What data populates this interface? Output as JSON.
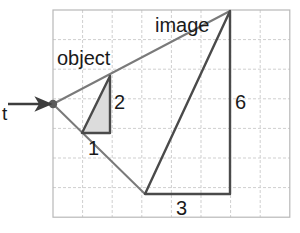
{
  "figure": {
    "background_color": "#ffffff",
    "grid": {
      "x0": 53,
      "y0": 10,
      "cell": 29.6,
      "cols": 8,
      "rows": 7,
      "line_color": "#cfcfcf",
      "border_color": "#b8b8b8",
      "style": "dashed"
    },
    "colors": {
      "stroke_dark": "#4a4a4a",
      "stroke_light": "#7a7a7a",
      "shade_fill": "#dcdcdc",
      "text": "#1a1a1a",
      "lens_point": "#5a5a5a"
    },
    "points": {
      "lens": [
        53,
        104
      ],
      "object_base_left": [
        82,
        133
      ],
      "object_base_right": [
        110,
        133
      ],
      "object_top": [
        110,
        76
      ],
      "image_apex": [
        230,
        11
      ],
      "image_base_left": [
        145,
        194
      ],
      "image_base_right": [
        230,
        194
      ]
    },
    "labels": {
      "object": "object",
      "image": "image",
      "dim_object_base": "1",
      "dim_object_height": "2",
      "dim_image_base": "3",
      "dim_image_height": "6",
      "lens_marker": "t"
    },
    "label_positions": {
      "object": [
        57,
        48
      ],
      "image": [
        155,
        15
      ],
      "dim_object_base": [
        88,
        138
      ],
      "dim_object_height": [
        114,
        92
      ],
      "dim_image_base": [
        176,
        198
      ],
      "dim_image_height": [
        235,
        92
      ],
      "lens_marker": [
        2,
        104
      ]
    },
    "arrow": {
      "from": [
        8,
        104
      ],
      "to": [
        50,
        104
      ],
      "color": "#3d3d3d"
    }
  },
  "chart_data": {
    "type": "diagram",
    "grid_units": {
      "cols": 8,
      "rows": 7
    },
    "shapes": [
      {
        "name": "object-triangle",
        "label": "object",
        "shaded": true,
        "base": 1,
        "height": 2,
        "vertices_grid": [
          [
            1,
            4.15
          ],
          [
            2,
            4.15
          ],
          [
            2,
            2.22
          ]
        ]
      },
      {
        "name": "image-triangle",
        "label": "image",
        "shaded": false,
        "base": 3,
        "height": 6,
        "vertices_grid": [
          [
            3.1,
            6.2
          ],
          [
            6,
            6.2
          ],
          [
            6,
            0.05
          ]
        ]
      }
    ],
    "dimension_labels": [
      "1",
      "2",
      "3",
      "6"
    ],
    "annotations": [
      "t"
    ]
  }
}
